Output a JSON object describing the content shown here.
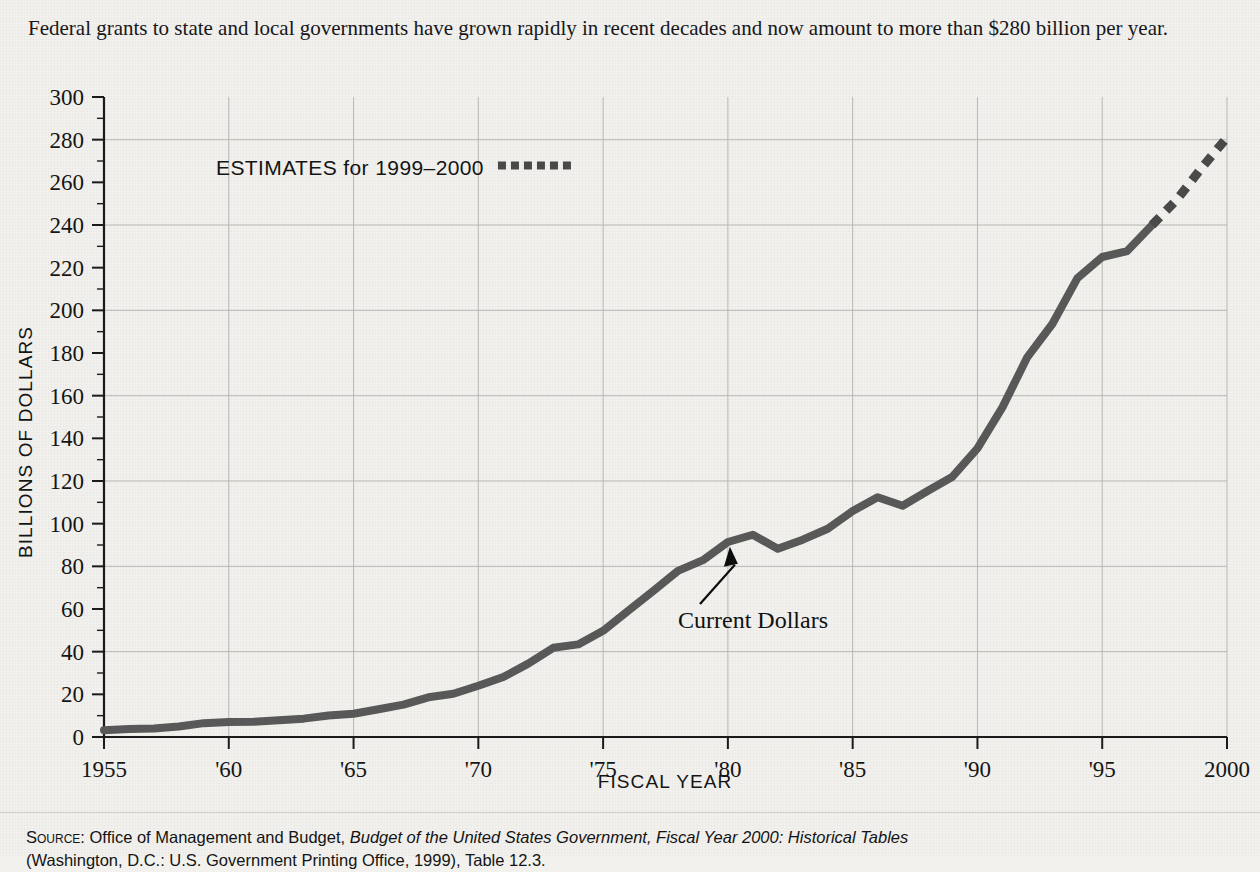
{
  "caption": "Federal grants to state and local governments have grown rapidly in recent decades and now amount to more than $280 billion per year.",
  "legend": {
    "label": "ESTIMATES for 1999–2000",
    "swatch": "dashed-line-swatch"
  },
  "annotation": {
    "label": "Current Dollars",
    "points_to_year": 1980,
    "points_to_value": 92
  },
  "source": {
    "prefix": "Source:",
    "line1_plain_a": " Office of Management and Budget, ",
    "line1_italic": "Budget of the United States Government, Fiscal Year 2000: Historical Tables",
    "line2": "(Washington, D.C.: U.S. Government Printing Office, 1999), Table 12.3."
  },
  "colors": {
    "background": "#f2f1ee",
    "line": "#595959",
    "estimate_line": "#4a4a4a",
    "grid": "#b9b9b6",
    "axis": "#1b1b1b",
    "text": "#151515"
  },
  "chart_data": {
    "type": "line",
    "title": "",
    "xlabel": "FISCAL YEAR",
    "ylabel": "BILLIONS OF DOLLARS",
    "xlim": [
      1955,
      2000
    ],
    "ylim": [
      0,
      300
    ],
    "ytick_step": 20,
    "ytick_minor_step": 10,
    "xtick_step": 5,
    "grid": "horizontal-every-40-and-vertical-every-5-years",
    "legend_position": "upper-left-inside",
    "ytick_labels": [
      "0",
      "20",
      "40",
      "60",
      "80",
      "100",
      "120",
      "140",
      "160",
      "180",
      "200",
      "220",
      "240",
      "260",
      "280",
      "300"
    ],
    "xtick_labels": [
      "1955",
      "'60",
      "'65",
      "'70",
      "'75",
      "'80",
      "'85",
      "'90",
      "'95",
      "2000"
    ],
    "xtick_values": [
      1955,
      1960,
      1965,
      1970,
      1975,
      1980,
      1985,
      1990,
      1995,
      2000
    ],
    "grid_y_values": [
      40,
      80,
      120,
      160,
      200,
      240,
      280
    ],
    "series": [
      {
        "name": "Current Dollars",
        "style": "solid",
        "x": [
          1955,
          1956,
          1957,
          1958,
          1959,
          1960,
          1961,
          1962,
          1963,
          1964,
          1965,
          1966,
          1967,
          1968,
          1969,
          1970,
          1971,
          1972,
          1973,
          1974,
          1975,
          1976,
          1977,
          1978,
          1979,
          1980,
          1981,
          1982,
          1983,
          1984,
          1985,
          1986,
          1987,
          1988,
          1989,
          1990,
          1991,
          1992,
          1993,
          1994,
          1995,
          1996,
          1997
        ],
        "y": [
          3.2,
          3.7,
          4.0,
          4.9,
          6.5,
          7.0,
          7.1,
          7.9,
          8.6,
          10.1,
          10.9,
          13.0,
          15.2,
          18.6,
          20.3,
          24.0,
          28.1,
          34.4,
          41.8,
          43.4,
          49.8,
          59.1,
          68.4,
          77.9,
          82.9,
          91.4,
          94.8,
          88.2,
          92.5,
          97.6,
          105.9,
          112.4,
          108.4,
          115.3,
          122.0,
          135.3,
          154.5,
          178.1,
          193.6,
          215.0,
          225.0,
          227.8,
          240.0
        ]
      },
      {
        "name": "Estimates 1999-2000",
        "style": "dashed",
        "x": [
          1997,
          1998,
          1999,
          2000
        ],
        "y": [
          240.0,
          252.0,
          267.0,
          281.0
        ]
      }
    ]
  }
}
